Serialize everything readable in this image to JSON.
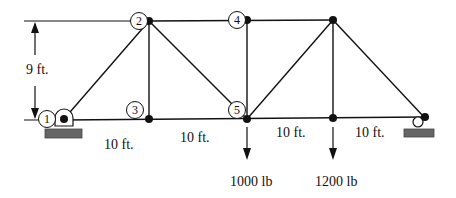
{
  "diagram": {
    "type": "truss",
    "nodes": [
      {
        "id": "1",
        "label": "1",
        "x": 64,
        "y": 119
      },
      {
        "id": "2",
        "label": "2",
        "x": 149,
        "y": 21
      },
      {
        "id": "3",
        "label": "3",
        "x": 149,
        "y": 119
      },
      {
        "id": "4",
        "label": "4",
        "x": 247,
        "y": 20
      },
      {
        "id": "5",
        "label": "5",
        "x": 247,
        "y": 119
      },
      {
        "id": "6",
        "label": "",
        "x": 333,
        "y": 20
      },
      {
        "id": "7",
        "label": "",
        "x": 333,
        "y": 118
      },
      {
        "id": "8",
        "label": "",
        "x": 424,
        "y": 117
      }
    ],
    "dimensions": {
      "height": "9 ft.",
      "spans": [
        "10 ft.",
        "10 ft.",
        "10 ft.",
        "10 ft."
      ]
    },
    "loads": [
      {
        "at": "5",
        "label": "1000 lb"
      },
      {
        "at": "7",
        "label": "1200 lb"
      }
    ],
    "supports": {
      "left": "pin",
      "right": "roller"
    },
    "colors": {
      "line": "#111111",
      "ground": "#666666"
    }
  }
}
